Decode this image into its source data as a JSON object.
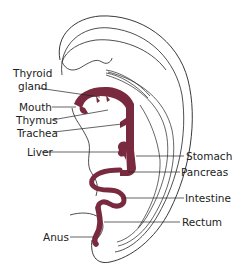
{
  "figure": {
    "gut_color": "#7a2a3e",
    "outline_color": "#222222",
    "background": "#ffffff"
  },
  "labels": {
    "thyroid_line1": "Thyroid",
    "thyroid_line2": "gland",
    "mouth": "Mouth",
    "thymus": "Thymus",
    "trachea": "Trachea",
    "liver": "Liver",
    "stomach": "Stomach",
    "pancreas": "Pancreas",
    "intestine": "Intestine",
    "rectum": "Rectum",
    "anus": "Anus"
  }
}
